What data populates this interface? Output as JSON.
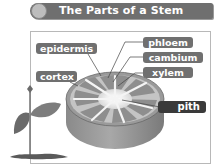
{
  "title": "The Parts of a Stem",
  "banner": {
    "icon": "circle-bullet-icon"
  },
  "labels": {
    "epidermis": "epidermis",
    "cortex": "cortex",
    "phloem": "phloem",
    "cambium": "cambium",
    "xylem": "xylem",
    "pith": "pith"
  },
  "illustrations": [
    "stem-cross-section",
    "plant-seedling"
  ],
  "colors": {
    "banner": "#6f6f6f",
    "label": "#707070",
    "label_dark": "#3a3a3a",
    "frame_border": "#b8b8b8"
  }
}
